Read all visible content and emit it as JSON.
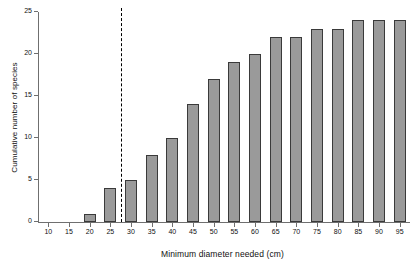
{
  "chart_data": {
    "type": "bar",
    "title": "",
    "subtitle": "",
    "xlabel": "Minimum diameter needed (cm)",
    "ylabel": "Cumulative number of species",
    "categories": [
      10,
      15,
      20,
      25,
      30,
      35,
      40,
      45,
      50,
      55,
      60,
      65,
      70,
      75,
      80,
      85,
      90,
      95
    ],
    "values": [
      0,
      0,
      1,
      4,
      5,
      8,
      10,
      14,
      17,
      19,
      20,
      22,
      22,
      23,
      23,
      24,
      24,
      24
    ],
    "xtick_labels": [
      "10",
      "15",
      "20",
      "25",
      "30",
      "35",
      "40",
      "45",
      "50",
      "55",
      "60",
      "65",
      "70",
      "75",
      "80",
      "85",
      "90",
      "95"
    ],
    "ytick_labels": [
      "0",
      "5",
      "10",
      "15",
      "20",
      "25"
    ],
    "yticks": [
      0,
      5,
      10,
      15,
      20,
      25
    ],
    "ylim": [
      0,
      25
    ],
    "xlim": [
      7.5,
      97.5
    ],
    "grid": false,
    "legend": null,
    "bar_fill_color": "#9a9a9a",
    "bar_edge_color": "#3a3a3a",
    "axis_color": "#6f6f6f",
    "annotations": [
      {
        "name": "threshold-line",
        "type": "vertical-dashed-line",
        "x": 27.5,
        "color": "#000000",
        "label": ""
      }
    ]
  }
}
